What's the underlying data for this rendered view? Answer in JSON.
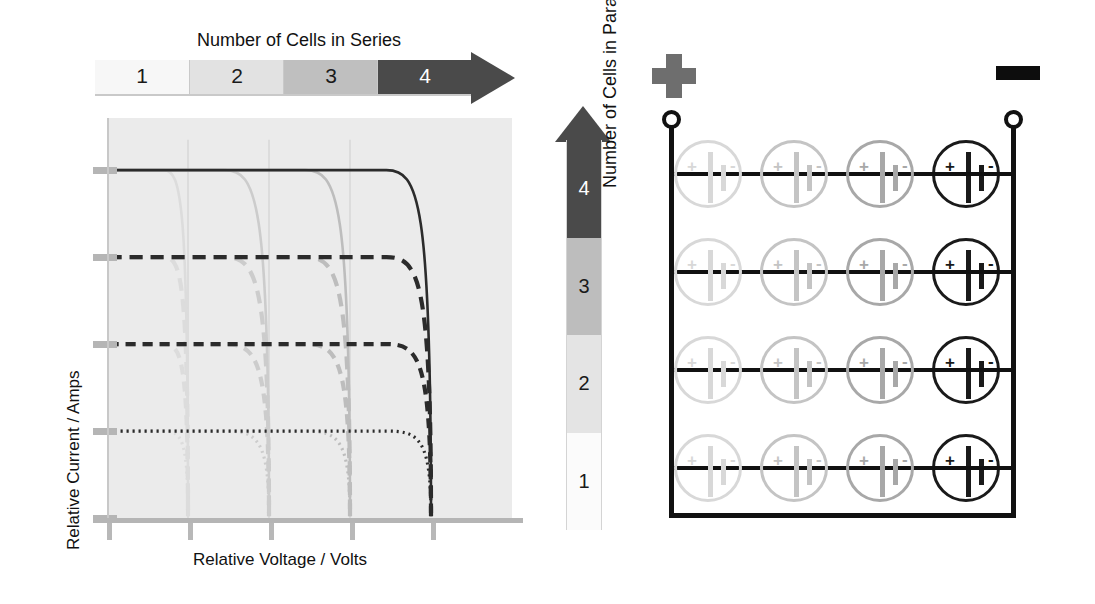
{
  "series_legend": {
    "title": "Number of Cells in Series",
    "bands": [
      {
        "label": "1",
        "color": "#f7f7f7"
      },
      {
        "label": "2",
        "color": "#e2e2e2"
      },
      {
        "label": "3",
        "color": "#bfbfbf"
      },
      {
        "label": "4",
        "color": "#4a4a4a"
      }
    ],
    "arrow_color": "#4a4a4a",
    "arrow_direction": "right"
  },
  "parallel_legend": {
    "title": "Number of Cells in Parallel",
    "bands": [
      {
        "label": "1",
        "color": "#fbfbfb"
      },
      {
        "label": "2",
        "color": "#e4e4e4"
      },
      {
        "label": "3",
        "color": "#bdbdbd"
      },
      {
        "label": "4",
        "color": "#4a4a4a"
      }
    ],
    "arrow_color": "#4a4a4a",
    "arrow_direction": "up"
  },
  "chart_data": {
    "type": "line",
    "title": "",
    "xlabel": "Relative Voltage / Volts",
    "ylabel": "Relative Current / Amps",
    "xlim": [
      0,
      5
    ],
    "ylim": [
      0,
      4.6
    ],
    "xticks": [
      0,
      1,
      2,
      3,
      4
    ],
    "yticks": [
      0,
      1,
      2,
      3,
      4
    ],
    "xtick_labels": [
      "",
      "",
      "",
      "",
      ""
    ],
    "ytick_labels": [
      "",
      "",
      "",
      "",
      ""
    ],
    "grid": false,
    "plot_background": "#ebebeb",
    "series": [
      {
        "name": "1 parallel, 1 series",
        "plateau_current": 1,
        "knee_voltage": 1,
        "color": "#dcdcdc",
        "dash": "dotted"
      },
      {
        "name": "1 parallel, 2 series",
        "plateau_current": 1,
        "knee_voltage": 2,
        "color": "#cccccc",
        "dash": "dotted"
      },
      {
        "name": "1 parallel, 3 series",
        "plateau_current": 1,
        "knee_voltage": 3,
        "color": "#bdbdbd",
        "dash": "dotted"
      },
      {
        "name": "1 parallel, 4 series",
        "plateau_current": 1,
        "knee_voltage": 4,
        "color": "#2b2b2b",
        "dash": "dotted"
      },
      {
        "name": "2 parallel, 1 series",
        "plateau_current": 2,
        "knee_voltage": 1,
        "color": "#dcdcdc",
        "dash": "dashed"
      },
      {
        "name": "2 parallel, 2 series",
        "plateau_current": 2,
        "knee_voltage": 2,
        "color": "#cccccc",
        "dash": "dashed"
      },
      {
        "name": "2 parallel, 3 series",
        "plateau_current": 2,
        "knee_voltage": 3,
        "color": "#bdbdbd",
        "dash": "dashed"
      },
      {
        "name": "2 parallel, 4 series",
        "plateau_current": 2,
        "knee_voltage": 4,
        "color": "#2b2b2b",
        "dash": "dashed"
      },
      {
        "name": "3 parallel, 1 series",
        "plateau_current": 3,
        "knee_voltage": 1,
        "color": "#dcdcdc",
        "dash": "dashed-long"
      },
      {
        "name": "3 parallel, 2 series",
        "plateau_current": 3,
        "knee_voltage": 2,
        "color": "#cccccc",
        "dash": "dashed-long"
      },
      {
        "name": "3 parallel, 3 series",
        "plateau_current": 3,
        "knee_voltage": 3,
        "color": "#bdbdbd",
        "dash": "dashed-long"
      },
      {
        "name": "3 parallel, 4 series",
        "plateau_current": 3,
        "knee_voltage": 4,
        "color": "#2b2b2b",
        "dash": "dashed-long"
      },
      {
        "name": "4 parallel, 1 series",
        "plateau_current": 4,
        "knee_voltage": 1,
        "color": "#dcdcdc",
        "dash": "solid"
      },
      {
        "name": "4 parallel, 2 series",
        "plateau_current": 4,
        "knee_voltage": 2,
        "color": "#cccccc",
        "dash": "solid"
      },
      {
        "name": "4 parallel, 3 series",
        "plateau_current": 4,
        "knee_voltage": 3,
        "color": "#bdbdbd",
        "dash": "solid"
      },
      {
        "name": "4 parallel, 4 series",
        "plateau_current": 4,
        "knee_voltage": 4,
        "color": "#2b2b2b",
        "dash": "solid"
      }
    ]
  },
  "battery_diagram": {
    "positive_terminal_label": "+",
    "negative_terminal_label": "-",
    "rows": 4,
    "columns": 4,
    "cell_plus_label": "+",
    "cell_minus_label": "-",
    "column_colors": [
      "#d8d8d8",
      "#c4c4c4",
      "#a8a8a8",
      "#1a1a1a"
    ],
    "wire_color": "#111111"
  }
}
